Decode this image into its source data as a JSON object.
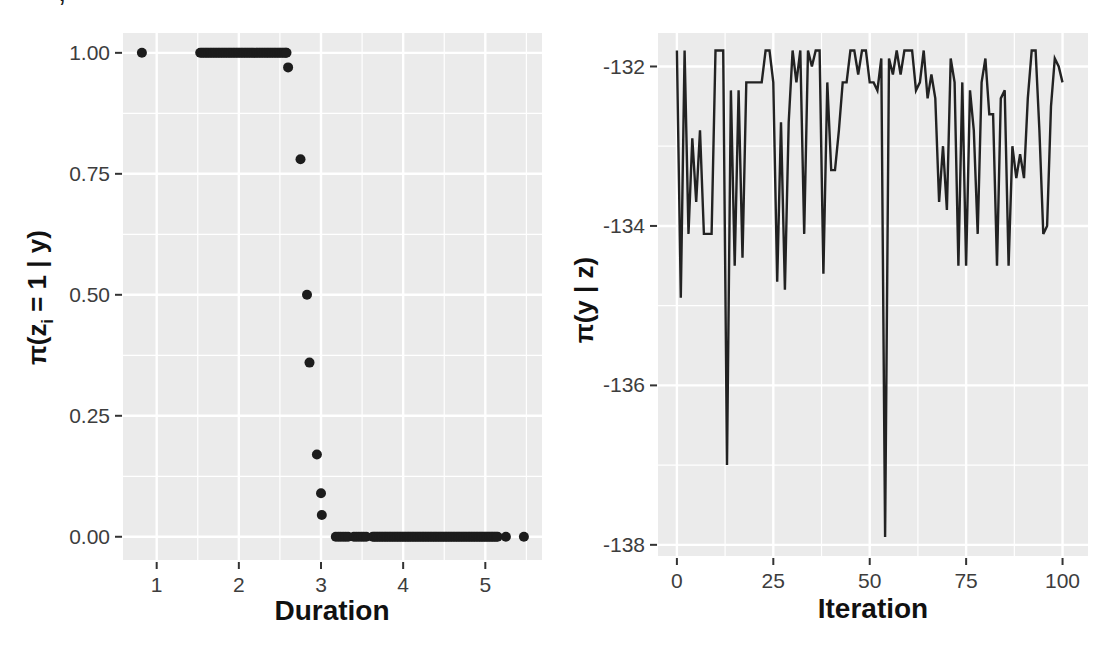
{
  "page": {
    "background": "#ffffff"
  },
  "artifacts": {
    "a": ",",
    "b": "."
  },
  "chart_data": [
    {
      "type": "scatter",
      "title": "",
      "xlabel": "Duration",
      "ylabel_text": "π(z_i = 1 | y)",
      "ylabel_parts": {
        "p0": "π(",
        "v1": "z",
        "sub": "i",
        "p1": " = 1 | ",
        "v2": "y",
        "p2": ")"
      },
      "xlim": [
        0.59,
        5.69
      ],
      "ylim": [
        -0.048,
        1.041
      ],
      "x_ticks": [
        1,
        2,
        3,
        4,
        5
      ],
      "x_tick_labels": [
        "1",
        "2",
        "3",
        "4",
        "5"
      ],
      "x_minor": [
        1.5,
        2.5,
        3.5,
        4.5,
        5.5
      ],
      "y_ticks": [
        0,
        0.25,
        0.5,
        0.75,
        1
      ],
      "y_tick_labels": [
        "0.00",
        "0.25",
        "0.50",
        "0.75",
        "1.00"
      ],
      "y_minor": [
        0.125,
        0.375,
        0.625,
        0.875
      ],
      "grid": true,
      "legend": "none",
      "styles": {
        "panel_bg": "#ebebeb",
        "grid": "#ffffff",
        "point": "#1c1c1c",
        "tick": "#333333",
        "tick_text": "#3d3d3d",
        "title_text": "#111111"
      },
      "point_radius": 5,
      "points": {
        "prob_one": {
          "y": 1.0,
          "x": [
            0.82,
            1.53,
            1.55,
            1.57,
            1.59,
            1.61,
            1.63,
            1.65,
            1.67,
            1.69,
            1.71,
            1.73,
            1.75,
            1.77,
            1.79,
            1.81,
            1.83,
            1.85,
            1.87,
            1.89,
            1.91,
            1.93,
            1.95,
            1.97,
            1.99,
            2.01,
            2.03,
            2.05,
            2.07,
            2.09,
            2.11,
            2.13,
            2.15,
            2.17,
            2.19,
            2.21,
            2.23,
            2.25,
            2.27,
            2.29,
            2.31,
            2.33,
            2.35,
            2.37,
            2.39,
            2.41,
            2.43,
            2.45,
            2.47,
            2.49,
            2.51,
            2.53,
            2.55,
            2.57,
            2.58
          ]
        },
        "transition": [
          [
            2.6,
            0.97
          ],
          [
            2.75,
            0.78
          ],
          [
            2.83,
            0.5
          ],
          [
            2.86,
            0.36
          ],
          [
            2.95,
            0.17
          ],
          [
            3.0,
            0.09
          ],
          [
            3.01,
            0.045
          ]
        ],
        "prob_zero": {
          "y": 0.0,
          "x": [
            3.18,
            3.21,
            3.24,
            3.27,
            3.3,
            3.33,
            3.4,
            3.43,
            3.46,
            3.49,
            3.52,
            3.55,
            3.63,
            3.65,
            3.67,
            3.69,
            3.71,
            3.73,
            3.75,
            3.77,
            3.79,
            3.81,
            3.83,
            3.85,
            3.87,
            3.89,
            3.91,
            3.93,
            3.95,
            3.97,
            3.99,
            4.01,
            4.03,
            4.05,
            4.07,
            4.09,
            4.11,
            4.13,
            4.15,
            4.17,
            4.19,
            4.21,
            4.23,
            4.25,
            4.27,
            4.29,
            4.31,
            4.33,
            4.35,
            4.37,
            4.39,
            4.41,
            4.43,
            4.45,
            4.47,
            4.49,
            4.51,
            4.53,
            4.55,
            4.57,
            4.59,
            4.61,
            4.63,
            4.65,
            4.67,
            4.69,
            4.71,
            4.73,
            4.75,
            4.77,
            4.79,
            4.81,
            4.83,
            4.85,
            4.87,
            4.89,
            4.91,
            4.93,
            4.95,
            4.97,
            4.99,
            5.01,
            5.03,
            5.05,
            5.07,
            5.09,
            5.11,
            5.13,
            5.15,
            5.25,
            5.47
          ]
        }
      }
    },
    {
      "type": "line",
      "title": "",
      "xlabel": "Iteration",
      "ylabel_text": "π(y | z)",
      "ylabel_parts": {
        "p0": "π(",
        "v1": "y",
        "p1": " | ",
        "v2": "z",
        "p2": ")"
      },
      "xlim": [
        -4.9,
        106.6
      ],
      "ylim": [
        -138.14,
        -131.58
      ],
      "x_ticks": [
        0,
        25,
        50,
        75,
        100
      ],
      "x_tick_labels": [
        "0",
        "25",
        "50",
        "75",
        "100"
      ],
      "x_minor": [
        12.5,
        37.5,
        62.5,
        87.5
      ],
      "y_ticks": [
        -138,
        -136,
        -134,
        -132
      ],
      "y_tick_labels": [
        "-138",
        "-136",
        "-134",
        "-132"
      ],
      "y_minor": [
        -137,
        -135,
        -133
      ],
      "grid": true,
      "legend": "none",
      "styles": {
        "panel_bg": "#ebebeb",
        "grid": "#ffffff",
        "line": "#222222",
        "tick": "#333333",
        "tick_text": "#3d3d3d",
        "title_text": "#111111"
      },
      "line_width": 2.4,
      "x_start": 0,
      "x_step": 1,
      "values": [
        -131.8,
        -134.9,
        -131.8,
        -134.1,
        -132.9,
        -133.7,
        -132.8,
        -134.1,
        -134.1,
        -134.1,
        -131.8,
        -131.8,
        -131.8,
        -137.0,
        -132.3,
        -134.5,
        -132.3,
        -134.4,
        -132.2,
        -132.2,
        -132.2,
        -132.2,
        -132.2,
        -131.8,
        -131.8,
        -132.2,
        -134.7,
        -132.7,
        -134.8,
        -132.7,
        -131.8,
        -132.2,
        -131.8,
        -134.1,
        -131.8,
        -132.0,
        -131.8,
        -131.8,
        -134.6,
        -132.2,
        -133.3,
        -133.3,
        -132.8,
        -132.2,
        -132.2,
        -131.8,
        -131.8,
        -132.1,
        -131.8,
        -131.8,
        -132.2,
        -132.2,
        -132.3,
        -131.9,
        -137.9,
        -131.9,
        -132.1,
        -131.8,
        -132.1,
        -131.8,
        -131.8,
        -131.8,
        -132.3,
        -132.2,
        -131.8,
        -132.4,
        -132.1,
        -132.4,
        -133.7,
        -133.0,
        -133.8,
        -131.9,
        -132.2,
        -134.5,
        -132.2,
        -134.5,
        -132.3,
        -132.8,
        -134.1,
        -132.2,
        -131.9,
        -132.6,
        -132.6,
        -134.5,
        -132.4,
        -132.3,
        -134.5,
        -133.0,
        -133.4,
        -133.1,
        -133.4,
        -132.4,
        -131.8,
        -131.8,
        -132.8,
        -134.1,
        -134.0,
        -132.5,
        -131.9,
        -132.0,
        -132.2
      ]
    }
  ]
}
